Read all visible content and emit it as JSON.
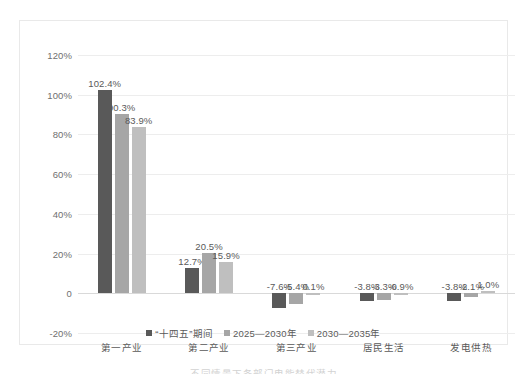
{
  "chart_data": {
    "type": "bar",
    "title": "",
    "subtitle": "",
    "xlabel": "",
    "ylabel": "",
    "categories": [
      "第一产业",
      "第二产业",
      "第三产业",
      "居民生活",
      "发电供热"
    ],
    "series": [
      {
        "name": "“十四五”期间",
        "color": "#595959",
        "values": [
          102.4,
          12.7,
          -7.6,
          -3.8,
          -3.8
        ]
      },
      {
        "name": "2025—2030年",
        "color": "#a6a6a6",
        "values": [
          90.3,
          20.5,
          -5.4,
          -3.3,
          -2.1
        ]
      },
      {
        "name": "2030—2035年",
        "color": "#bfbfbf",
        "values": [
          83.9,
          15.9,
          0.1,
          -0.9,
          1.0
        ]
      }
    ],
    "value_labels": [
      [
        "102.4%",
        "90.3%",
        "83.9%"
      ],
      [
        "12.7%",
        "20.5%",
        "15.9%"
      ],
      [
        "-7.6%",
        "-5.4%",
        "0.1%"
      ],
      [
        "-3.8%",
        "-3.3%",
        "-0.9%"
      ],
      [
        "-3.8%",
        "-2.1%",
        "1.0%"
      ]
    ],
    "ylim": [
      -20,
      120
    ],
    "yticks": [
      120,
      100,
      80,
      60,
      40,
      20,
      0,
      -20
    ],
    "ytick_labels": [
      "120%",
      "100%",
      "80%",
      "60%",
      "40%",
      "20%",
      "0",
      "-20%"
    ],
    "grid": true,
    "legend_position": "bottom",
    "units": "percent"
  },
  "legend": {
    "items": [
      {
        "label": "“十四五”期间"
      },
      {
        "label": "2025—2030年"
      },
      {
        "label": "2030—2035年"
      }
    ]
  },
  "caption": {
    "text": "不同情景下各部门电能替代潜力"
  }
}
